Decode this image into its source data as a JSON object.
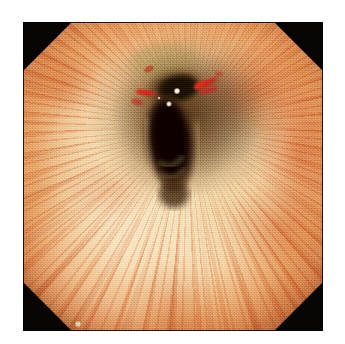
{
  "image": {
    "kind": "endoscopy-photograph",
    "modality_label": "upper gastrointestinal endoscopy",
    "anatomy_label": "esophageal lumen",
    "caption": "",
    "canvas": {
      "width": 345,
      "height": 344,
      "background_color": "#ffffff"
    },
    "frame": {
      "x": 23,
      "y": 22,
      "width": 300,
      "height": 309,
      "border_color": "#080604",
      "shape": "octagon",
      "corner_cut_ratio": 0.163
    },
    "palette": {
      "matte_black": "#080604",
      "page_white": "#ffffff",
      "mucosa_cream": "#f3e0b4",
      "mucosa_pale_yellow": "#eec793",
      "mucosa_orange": "#e0935a",
      "erythema_orange": "#d86a2c",
      "vascular_red": "#ba4622",
      "blood_red": "#d21f16",
      "lumen_dark": "#2b1408",
      "lumen_core": "#0d0603",
      "specular_white": "#fdfaf0"
    },
    "features": [
      {
        "name": "central-lumen",
        "label": "Central lumen opening",
        "x": 168,
        "y": 135,
        "width": 58,
        "height": 105,
        "color": "#160a04"
      },
      {
        "name": "upper-dark-recess",
        "label": "Upper dark recess",
        "x": 175,
        "y": 86,
        "width": 52,
        "height": 36,
        "color": "#2a1a0c"
      },
      {
        "name": "specular-highlight-primary",
        "label": "Specular light reflection",
        "x": 177,
        "y": 91,
        "radius": 3,
        "color": "#fdfaf0"
      },
      {
        "name": "specular-highlight-secondary",
        "label": "Secondary light reflection",
        "x": 169,
        "y": 104,
        "radius": 3,
        "color": "#f7f0dc"
      },
      {
        "name": "blood-streak-right",
        "label": "Bright red mucosal streak (right)",
        "x": 196,
        "y": 84,
        "width": 22,
        "height": 7,
        "color": "#d8281a"
      },
      {
        "name": "blood-streak-left",
        "label": "Bright red mucosal streak (left)",
        "x": 152,
        "y": 90,
        "width": 18,
        "height": 6,
        "color": "#c8281c"
      },
      {
        "name": "blood-fleck-upper",
        "label": "Red fleck above lumen",
        "x": 148,
        "y": 68,
        "width": 8,
        "height": 5,
        "color": "#cf2a1c"
      },
      {
        "name": "calibration-marker",
        "label": "Small pale marker",
        "x": 78,
        "y": 324,
        "radius": 3,
        "color": "#e9dcb6"
      }
    ],
    "radial_streaks": {
      "label": "Radiating vascular / erythematous mucosal folds",
      "origin_x_pct": 55,
      "origin_y_pct": 34,
      "color": "#d6602f",
      "count": 100
    }
  }
}
